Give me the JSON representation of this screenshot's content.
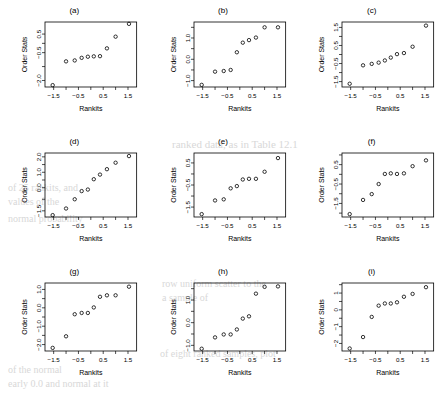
{
  "figure": {
    "type": "multi-panel-figure",
    "panel_count": 9,
    "rows": 3,
    "cols": 3,
    "shared_xlabel": "Rankits",
    "shared_ylabel": "Order Stats",
    "point_symbol": "open-circle",
    "colors": {
      "ink": "#000000",
      "background": "#ffffff",
      "bleed_through": "#d8d8d8"
    }
  },
  "bleed_text": [
    {
      "text": "ranked data, as in Table 12.1",
      "x": 172,
      "y": 138,
      "size": 11
    },
    {
      "text": "of 25 rankits, and",
      "x": 8,
      "y": 182,
      "size": 10
    },
    {
      "text": "values of the",
      "x": 8,
      "y": 196,
      "size": 10
    },
    {
      "text": "normal probability",
      "x": 8,
      "y": 213,
      "size": 10
    },
    {
      "text": "row uniform scatter to the",
      "x": 162,
      "y": 278,
      "size": 10
    },
    {
      "text": "a sample of",
      "x": 162,
      "y": 292,
      "size": 10
    },
    {
      "text": "of eight ranked samples, plot",
      "x": 160,
      "y": 348,
      "size": 10
    },
    {
      "text": "of the normal",
      "x": 8,
      "y": 364,
      "size": 10
    },
    {
      "text": "early 0.0 and normal at it",
      "x": 8,
      "y": 378,
      "size": 10
    }
  ],
  "chart_data": [
    {
      "id": "a",
      "type": "scatter",
      "title": "(a)",
      "xlabel": "Rankits",
      "ylabel": "Order Stats",
      "xlim": [
        -1.85,
        1.85
      ],
      "ylim": [
        -2.35,
        1.15
      ],
      "xticks": [
        -1.5,
        -0.5,
        0.5,
        1.5
      ],
      "xticklabels": [
        "-1.5",
        "-0.5",
        "0.5",
        "1.5"
      ],
      "yticks": [
        -2.0,
        -0.5,
        0.5
      ],
      "yticklabels": [
        "-2.0",
        "-0.5",
        "0.5"
      ],
      "grid": false,
      "x": [
        -1.54,
        -1.0,
        -0.65,
        -0.37,
        -0.12,
        0.12,
        0.37,
        0.65,
        1.0,
        1.54
      ],
      "y": [
        -2.25,
        -0.97,
        -0.92,
        -0.78,
        -0.72,
        -0.7,
        -0.69,
        -0.27,
        0.36,
        1.05
      ]
    },
    {
      "id": "b",
      "type": "scatter",
      "title": "(b)",
      "xlabel": "Rankits",
      "ylabel": "Order Stats",
      "xlim": [
        -1.85,
        1.85
      ],
      "ylim": [
        -1.3,
        1.75
      ],
      "xticks": [
        -1.5,
        -0.5,
        0.5,
        1.5
      ],
      "xticklabels": [
        "-1.5",
        "-0.5",
        "0.5",
        "1.5"
      ],
      "yticks": [
        -1.0,
        0.0,
        1.0
      ],
      "yticklabels": [
        "-1.0",
        "0.0",
        "1.0"
      ],
      "grid": false,
      "x": [
        -1.54,
        -1.0,
        -0.65,
        -0.37,
        -0.12,
        0.12,
        0.37,
        0.65,
        1.0,
        1.54
      ],
      "y": [
        -1.2,
        -0.58,
        -0.55,
        -0.5,
        0.33,
        0.78,
        0.9,
        1.02,
        1.5,
        1.5
      ]
    },
    {
      "id": "c",
      "type": "scatter",
      "title": "(c)",
      "xlabel": "Rankits",
      "ylabel": "Order Stats",
      "xlim": [
        -1.85,
        1.85
      ],
      "ylim": [
        -1.8,
        1.8
      ],
      "xticks": [
        -1.5,
        -0.5,
        0.5,
        1.5
      ],
      "xticklabels": [
        "-1.5",
        "-0.5",
        "0.5",
        "1.5"
      ],
      "yticks": [
        -1.5,
        -0.5,
        0.5,
        1.5
      ],
      "yticklabels": [
        "-1.5",
        "-0.5",
        "0.5",
        "1.5"
      ],
      "grid": false,
      "x": [
        -1.54,
        -1.0,
        -0.65,
        -0.37,
        -0.12,
        0.12,
        0.37,
        0.65,
        1.0,
        1.54
      ],
      "y": [
        -1.62,
        -0.6,
        -0.52,
        -0.45,
        -0.33,
        -0.17,
        0.02,
        0.08,
        0.43,
        1.6
      ]
    },
    {
      "id": "d",
      "type": "scatter",
      "title": "(d)",
      "xlabel": "Rankits",
      "ylabel": "Order Stats",
      "xlim": [
        -1.85,
        1.85
      ],
      "ylim": [
        -1.9,
        2.25
      ],
      "xticks": [
        -1.5,
        -0.5,
        0.5,
        1.5
      ],
      "xticklabels": [
        "-1.5",
        "-0.5",
        "0.5",
        "1.5"
      ],
      "yticks": [
        -1.5,
        0.0,
        1.0,
        2.0
      ],
      "yticklabels": [
        "-1.5",
        "0.0",
        "1.0",
        "2.0"
      ],
      "grid": false,
      "x": [
        -1.54,
        -1.0,
        -0.65,
        -0.37,
        -0.12,
        0.12,
        0.37,
        0.65,
        1.0,
        1.54
      ],
      "y": [
        -1.78,
        -1.35,
        -0.75,
        -0.22,
        -0.12,
        0.55,
        0.85,
        1.2,
        1.62,
        2.05
      ]
    },
    {
      "id": "e",
      "type": "scatter",
      "title": "(e)",
      "xlabel": "Rankits",
      "ylabel": "Order Stats",
      "xlim": [
        -1.85,
        1.85
      ],
      "ylim": [
        -1.95,
        0.95
      ],
      "xticks": [
        -1.5,
        -0.5,
        0.5,
        1.5
      ],
      "xticklabels": [
        "-1.5",
        "-0.5",
        "0.5",
        "1.5"
      ],
      "yticks": [
        -1.5,
        -0.5,
        0.5
      ],
      "yticklabels": [
        "-1.5",
        "-0.5",
        "0.5"
      ],
      "grid": false,
      "x": [
        -1.54,
        -1.0,
        -0.65,
        -0.37,
        -0.12,
        0.12,
        0.37,
        0.65,
        1.0,
        1.54
      ],
      "y": [
        -1.82,
        -1.2,
        -1.15,
        -0.65,
        -0.55,
        -0.25,
        -0.22,
        -0.22,
        0.1,
        0.72
      ]
    },
    {
      "id": "f",
      "type": "scatter",
      "title": "(f)",
      "xlabel": "Rankits",
      "ylabel": "Order Stats",
      "xlim": [
        -1.85,
        1.85
      ],
      "ylim": [
        -2.2,
        1.1
      ],
      "xticks": [
        -1.5,
        -0.5,
        0.5,
        1.5
      ],
      "xticklabels": [
        "-1.5",
        "-0.5",
        "0.5",
        "1.5"
      ],
      "yticks": [
        -1.5,
        -0.5,
        0.5
      ],
      "yticklabels": [
        "-1.5",
        "-0.5",
        "0.5"
      ],
      "grid": false,
      "x": [
        -1.54,
        -1.0,
        -0.65,
        -0.37,
        -0.12,
        0.12,
        0.37,
        0.65,
        1.0,
        1.54
      ],
      "y": [
        -2.05,
        -1.32,
        -1.02,
        -0.5,
        0.02,
        0.05,
        0.02,
        0.05,
        0.42,
        0.72
      ]
    },
    {
      "id": "g",
      "type": "scatter",
      "title": "(g)",
      "xlabel": "Rankits",
      "ylabel": "Order Stats",
      "xlim": [
        -1.85,
        1.85
      ],
      "ylim": [
        -2.35,
        1.35
      ],
      "xticks": [
        -1.5,
        -0.5,
        0.5,
        1.5
      ],
      "xticklabels": [
        "-1.5",
        "-0.5",
        "0.5",
        "1.5"
      ],
      "yticks": [
        -2.0,
        -1.0,
        0.0,
        1.0
      ],
      "yticklabels": [
        "-2.0",
        "-1.0",
        "0.0",
        "1.0"
      ],
      "grid": false,
      "x": [
        -1.54,
        -1.0,
        -0.65,
        -0.37,
        -0.12,
        0.12,
        0.37,
        0.65,
        1.0,
        1.54
      ],
      "y": [
        -2.18,
        -1.55,
        -0.35,
        -0.28,
        -0.28,
        0.02,
        0.6,
        0.68,
        0.68,
        1.15
      ]
    },
    {
      "id": "h",
      "type": "scatter",
      "title": "(h)",
      "xlabel": "Rankits",
      "ylabel": "Order Stats",
      "xlim": [
        -1.85,
        1.85
      ],
      "ylim": [
        -1.25,
        1.75
      ],
      "xticks": [
        -1.5,
        -0.5,
        0.5,
        1.5
      ],
      "xticklabels": [
        "-1.5",
        "-0.5",
        "0.5",
        "1.5"
      ],
      "yticks": [
        -1.0,
        0.0,
        1.0
      ],
      "yticklabels": [
        "-1.0",
        "0.0",
        "1.0"
      ],
      "grid": false,
      "x": [
        -1.54,
        -1.0,
        -0.65,
        -0.37,
        -0.12,
        0.12,
        0.37,
        0.65,
        1.0,
        1.54
      ],
      "y": [
        -1.15,
        -0.65,
        -0.52,
        -0.52,
        -0.3,
        0.18,
        0.28,
        1.28,
        1.58,
        1.6
      ]
    },
    {
      "id": "i",
      "type": "scatter",
      "title": "(i)",
      "xlabel": "Rankits",
      "ylabel": "Order Stats",
      "xlim": [
        -1.85,
        1.85
      ],
      "ylim": [
        -2.45,
        1.6
      ],
      "xticks": [
        -1.5,
        -0.5,
        0.5,
        1.5
      ],
      "xticklabels": [
        "-1.5",
        "-0.5",
        "0.5",
        "1.5"
      ],
      "yticks": [
        -2,
        -1,
        0,
        1
      ],
      "yticklabels": [
        "-2",
        "-1",
        "0",
        "1"
      ],
      "grid": false,
      "x": [
        -1.54,
        -1.0,
        -0.65,
        -0.37,
        -0.12,
        0.12,
        0.37,
        0.65,
        1.0,
        1.54
      ],
      "y": [
        -2.3,
        -1.62,
        -0.42,
        0.25,
        0.38,
        0.38,
        0.45,
        0.78,
        0.95,
        1.35
      ]
    }
  ]
}
